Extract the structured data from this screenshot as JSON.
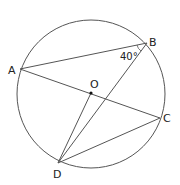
{
  "diagram": {
    "type": "circle-geometry",
    "circle": {
      "center_label": "O",
      "cx": 91,
      "cy": 94,
      "r": 74
    },
    "points": [
      {
        "label": "A",
        "x": 20,
        "y": 69,
        "lx": 8,
        "ly": 74
      },
      {
        "label": "B",
        "x": 147,
        "y": 43,
        "lx": 149,
        "ly": 46
      },
      {
        "label": "C",
        "x": 160,
        "y": 118,
        "lx": 163,
        "ly": 122
      },
      {
        "label": "D",
        "x": 58,
        "y": 163,
        "lx": 53,
        "ly": 178
      },
      {
        "label": "O",
        "x": 91,
        "y": 93,
        "lx": 90,
        "ly": 88
      }
    ],
    "segments": [
      "AB",
      "AC",
      "BD",
      "OD",
      "DC"
    ],
    "angle_label": "40°",
    "angle_at": "B"
  }
}
